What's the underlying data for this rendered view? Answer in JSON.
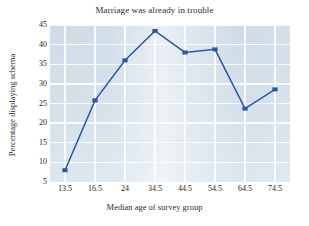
{
  "chart_data": {
    "type": "line",
    "title": "Marriage was already in trouble",
    "xlabel": "Median age of survey group",
    "ylabel": "Percentage displaying schema",
    "categories": [
      "13.5",
      "16.5",
      "24",
      "34.5",
      "44.5",
      "54.5",
      "64.5",
      "74.5"
    ],
    "values": [
      8,
      25.8,
      36,
      43.5,
      38,
      38.8,
      23.7,
      28.6
    ],
    "yticks": [
      5,
      10,
      15,
      20,
      25,
      30,
      35,
      40,
      45
    ],
    "ylim": [
      5,
      45
    ],
    "grid": true,
    "legend": "none",
    "series_color": "#2d57a5",
    "plot_background": "#d5e0e9",
    "gridline_color": "#fbfdfe",
    "marker": "square"
  }
}
